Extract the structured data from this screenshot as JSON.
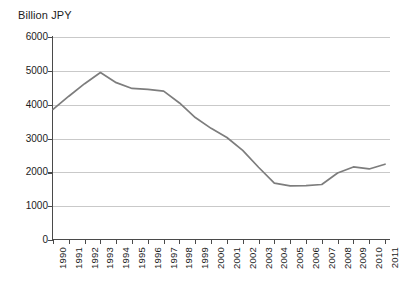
{
  "chart_data": {
    "type": "line",
    "title": "Billion JPY",
    "xlabel": "",
    "ylabel": "Billion JPY",
    "ylim": [
      0,
      6000
    ],
    "ytick_labels": [
      "0",
      "1000",
      "2000",
      "3000",
      "4000",
      "5000",
      "6000"
    ],
    "ytick_values": [
      0,
      1000,
      2000,
      3000,
      4000,
      5000,
      6000
    ],
    "grid": true,
    "legend": "none",
    "line_color": "#7d7d7d",
    "categories": [
      "1990",
      "1991",
      "1992",
      "1993",
      "1994",
      "1995",
      "1996",
      "1997",
      "1998",
      "1999",
      "2000",
      "2001",
      "2002",
      "2003",
      "2004",
      "2005",
      "2006",
      "2007",
      "2008",
      "2009",
      "2010",
      "2011"
    ],
    "values": [
      3860,
      4250,
      4620,
      4950,
      4650,
      4480,
      4450,
      4400,
      4050,
      3620,
      3300,
      3030,
      2650,
      2150,
      1680,
      1600,
      1610,
      1640,
      1980,
      2160,
      2100,
      2240
    ],
    "series": [
      {
        "name": "Billion JPY",
        "values": [
          3860,
          4250,
          4620,
          4950,
          4650,
          4480,
          4450,
          4400,
          4050,
          3620,
          3300,
          3030,
          2650,
          2150,
          1680,
          1600,
          1610,
          1640,
          1980,
          2160,
          2100,
          2240
        ]
      }
    ]
  }
}
